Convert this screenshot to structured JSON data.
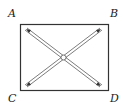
{
  "diagram": {
    "type": "rectangle-with-diagonals",
    "labels": {
      "top_left": "A",
      "top_right": "B",
      "bottom_left": "C",
      "bottom_right": "D"
    },
    "colors": {
      "stroke": "#333333",
      "background": "#ffffff"
    },
    "arrows": [
      {
        "from": "A",
        "to": "D",
        "style": "double-line, arrowheads both ends"
      },
      {
        "from": "B",
        "to": "C",
        "style": "double-line, arrowheads both ends"
      }
    ],
    "center_marker": "small circle at intersection"
  }
}
